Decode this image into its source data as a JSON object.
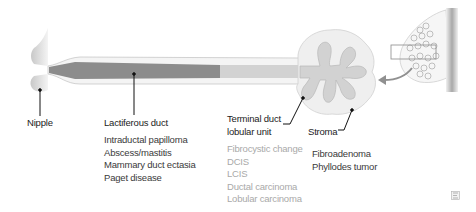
{
  "labels": {
    "nipple": "Nipple",
    "lactiferous_duct": "Lactiferous duct",
    "tdlu_line1": "Terminal duct",
    "tdlu_line2": "lobular unit",
    "stroma": "Stroma"
  },
  "lists": {
    "lactiferous_duct": [
      "Intraductal papilloma",
      "Abscess/mastitis",
      "Mammary duct ectasia",
      "Paget disease"
    ],
    "tdlu": [
      "Fibrocystic change",
      "DCIS",
      "LCIS",
      "Ductal carcinoma",
      "Lobular carcinoma"
    ],
    "stroma": [
      "Fibroadenoma",
      "Phyllodes tumor"
    ]
  },
  "colors": {
    "duct_dark": "#8c8c8c",
    "duct_light": "#d2d2d2",
    "stroma": "#eeeeee",
    "outline": "#c4c4c4",
    "label_dark": "#222222",
    "list_dark": "#3a3a3a",
    "list_light": "#a9a9a9"
  },
  "icons": {
    "inset_arrow": "curved-arrow-icon",
    "corner": "figure-badge-icon"
  }
}
